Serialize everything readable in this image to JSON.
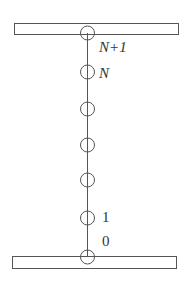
{
  "diagram": {
    "colors": {
      "stroke": "#555555",
      "text": "#333333",
      "background": "#ffffff"
    },
    "plates": [
      {
        "name": "top-plate",
        "x": 14,
        "y": 23,
        "width": 164,
        "height": 11
      },
      {
        "name": "bottom-plate",
        "x": 12,
        "y": 256,
        "width": 164,
        "height": 12
      }
    ],
    "chain_line": {
      "x": 87,
      "y1": 33,
      "y2": 257
    },
    "nodes": [
      {
        "y": 33,
        "label": "N+1"
      },
      {
        "y": 72,
        "label": "N"
      },
      {
        "y": 109,
        "label": ""
      },
      {
        "y": 145,
        "label": ""
      },
      {
        "y": 180,
        "label": ""
      },
      {
        "y": 218,
        "label": "1"
      },
      {
        "y": 257,
        "label": "0"
      }
    ],
    "labels": {
      "n_plus_1": "N+1",
      "n": "N",
      "one": "1",
      "zero": "0"
    }
  }
}
